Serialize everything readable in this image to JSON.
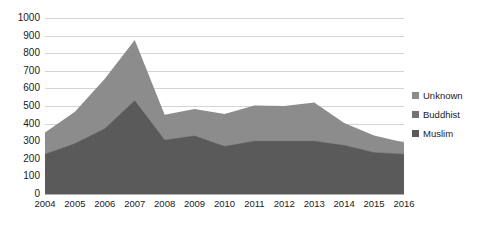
{
  "chart_data": {
    "type": "area",
    "stacked": true,
    "title": "",
    "xlabel": "",
    "ylabel": "",
    "categories": [
      "2004",
      "2005",
      "2006",
      "2007",
      "2008",
      "2009",
      "2010",
      "2011",
      "2012",
      "2013",
      "2014",
      "2015",
      "2016"
    ],
    "series": [
      {
        "name": "Muslim",
        "color": "#5a5a5a",
        "values": [
          225,
          285,
          370,
          530,
          305,
          330,
          270,
          300,
          300,
          300,
          275,
          235,
          225
        ]
      },
      {
        "name": "Buddhist",
        "color": "#737373",
        "values": [
          3,
          3,
          3,
          3,
          3,
          3,
          3,
          3,
          3,
          3,
          3,
          3,
          3
        ]
      },
      {
        "name": "Unknown",
        "color": "#8c8c8c",
        "values": [
          122,
          180,
          282,
          342,
          142,
          150,
          182,
          200,
          197,
          217,
          125,
          95,
          65
        ]
      }
    ],
    "totals": [
      350,
      468,
      655,
      875,
      450,
      483,
      455,
      503,
      500,
      520,
      403,
      333,
      293
    ],
    "ylim": [
      0,
      1000
    ],
    "yticks": [
      0,
      100,
      200,
      300,
      400,
      500,
      600,
      700,
      800,
      900,
      1000
    ],
    "ytick_labels": [
      "0",
      "100",
      "200",
      "300",
      "400",
      "500",
      "600",
      "700",
      "800",
      "900",
      "1000"
    ],
    "grid": true,
    "legend_position": "right",
    "legend": [
      "Unknown",
      "Buddhist",
      "Muslim"
    ]
  },
  "legend": {
    "items": [
      {
        "label": "Unknown",
        "color": "#8c8c8c"
      },
      {
        "label": "Buddhist",
        "color": "#737373"
      },
      {
        "label": "Muslim",
        "color": "#5a5a5a"
      }
    ]
  }
}
